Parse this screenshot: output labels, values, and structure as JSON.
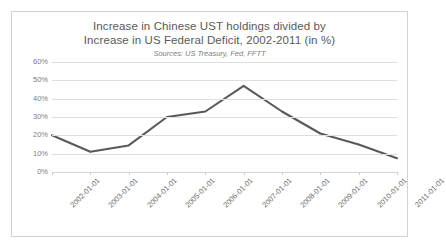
{
  "chart_data": {
    "type": "line",
    "title": "Increase in Chinese UST holdings divided by Increase in US Federal Deficit, 2002-2011 (in %)",
    "title_lines": [
      "Increase in Chinese UST holdings  divided by",
      "Increase in US Federal Deficit, 2002-2011 (in %)"
    ],
    "subtitle": "Sources: US Treasury, Fed, FFTT",
    "xlabel": "",
    "ylabel": "",
    "categories": [
      "2002-01-01",
      "2003-01-01",
      "2004-01-01",
      "2005-01-01",
      "2006-01-01",
      "2007-01-01",
      "2008-01-01",
      "2009-01-01",
      "2010-01-01",
      "2011-01-01"
    ],
    "values": [
      20,
      11,
      14.5,
      30,
      33,
      47,
      33,
      21,
      15,
      7.5
    ],
    "value_labels": [
      "20%",
      "11%",
      "15%",
      "30%",
      "33%",
      "47%",
      "33%",
      "21%",
      "15%",
      "8%"
    ],
    "ylim": [
      0,
      60
    ],
    "ytick_values": [
      0,
      10,
      20,
      30,
      40,
      50,
      60
    ],
    "ytick_labels": [
      "0%",
      "10%",
      "20%",
      "30%",
      "40%",
      "50%",
      "60%"
    ],
    "grid": true,
    "legend": false,
    "legend_position": "none",
    "series": [
      {
        "name": "Increase in Chinese UST holdings / Increase in US Federal Deficit",
        "color": "#595959",
        "values": [
          20,
          11,
          14.5,
          30,
          33,
          47,
          33,
          21,
          15,
          7.5
        ]
      }
    ],
    "colors": {
      "line": "#595959",
      "gridline": "#dedede",
      "axis_text": "#808080",
      "title_text": "#5a5a5a",
      "subtitle_text": "#7c7c7c",
      "frame_border": "#d2d2d2",
      "plot_background": "#ffffff"
    }
  }
}
